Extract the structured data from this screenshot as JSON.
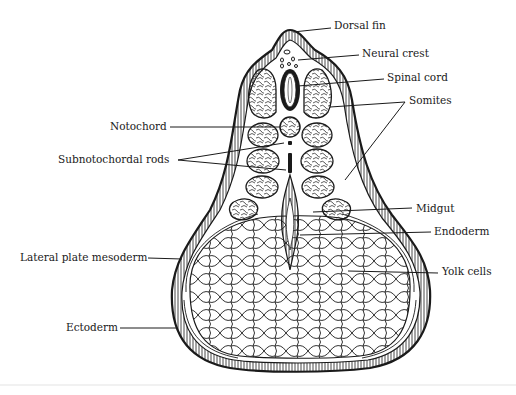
{
  "diagram": {
    "labels": {
      "dorsal_fin": "Dorsal fin",
      "neural_crest": "Neural crest",
      "spinal_cord": "Spinal cord",
      "somites": "Somites",
      "notochord": "Notochord",
      "subnotochordal_rods": "Subnotochordal rods",
      "midgut": "Midgut",
      "endoderm": "Endoderm",
      "yolk_cells": "Yolk cells",
      "lateral_plate_mesoderm": "Lateral plate mesoderm",
      "ectoderm": "Ectoderm"
    },
    "colors": {
      "ink": "#1a1a1a",
      "background": "#ffffff"
    }
  }
}
